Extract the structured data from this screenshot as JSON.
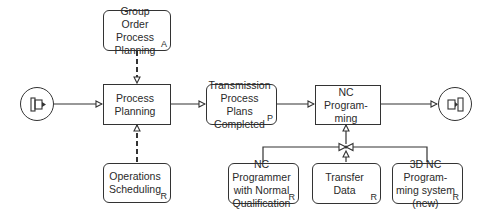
{
  "diagram": {
    "type": "event-driven process chain",
    "nodes": {
      "group_order": {
        "label": "Group Order\nProcess\nPlanning",
        "tag": "A"
      },
      "process_planning": {
        "label": "Process\nPlanning"
      },
      "operations_scheduling": {
        "label": "Operations\nScheduling",
        "tag": "R"
      },
      "transmission": {
        "label": "Transmission\nProcess Plans\nCompleted",
        "tag": "P"
      },
      "nc_programming": {
        "label": "NC Program-\nming"
      },
      "nc_programmer": {
        "label": "NC Programmer\nwith Normal\nQualification",
        "tag": "R"
      },
      "transfer_data": {
        "label": "Transfer Data",
        "tag": "R"
      },
      "nc_system": {
        "label": "3D NC Program-\nming system\n(new)",
        "tag": "R"
      }
    },
    "start_icon": "process-interface-in-icon",
    "end_icon": "process-interface-out-icon",
    "connector": "and-connector-icon",
    "colors": {
      "stroke": "#333333",
      "background": "#ffffff",
      "text": "#2a2a2a"
    }
  }
}
